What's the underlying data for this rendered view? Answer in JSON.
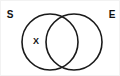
{
  "figure": {
    "type": "venn-diagram",
    "background_color": "#ffffff",
    "stroke_color": "#1a1a1a",
    "text_color": "#111111",
    "width": 120,
    "height": 76
  },
  "sets": [
    {
      "id": "left",
      "label": "S",
      "label_position": "outer-top-left",
      "label_x": 9,
      "label_y": 14,
      "center_x": 49,
      "center_y": 41,
      "radius": 28
    },
    {
      "id": "right",
      "label": "E",
      "label_position": "outer-top-right",
      "label_x": 111,
      "label_y": 14,
      "center_x": 73,
      "center_y": 41,
      "radius": 28
    }
  ],
  "elements": [
    {
      "label": "X",
      "region": "left-only",
      "x": 35,
      "y": 41
    }
  ]
}
